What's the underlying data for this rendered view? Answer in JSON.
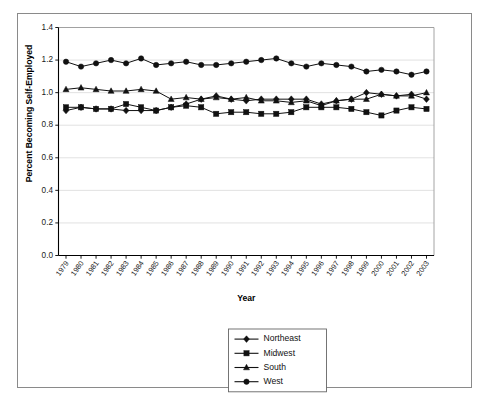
{
  "chart_data": {
    "type": "line",
    "title": "",
    "xlabel": "Year",
    "ylabel": "Percent Becoming Self-Employed",
    "ylim": [
      0.0,
      1.4
    ],
    "ytick_values": [
      0.0,
      0.2,
      0.4,
      0.6,
      0.8,
      1.0,
      1.2,
      1.4
    ],
    "ytick_labels": [
      "0.0",
      "0.2",
      "0.4",
      "0.6",
      "0.8",
      "1.0",
      "1.2",
      "1.4"
    ],
    "grid": "horizontal",
    "legend_position": "bottom-center",
    "x": [
      1979,
      1980,
      1981,
      1982,
      1983,
      1984,
      1985,
      1986,
      1987,
      1988,
      1989,
      1990,
      1991,
      1992,
      1993,
      1994,
      1995,
      1996,
      1997,
      1998,
      1999,
      2000,
      2001,
      2002,
      2003
    ],
    "xtick_labels": [
      "1979",
      "1980",
      "1981",
      "1982",
      "1983",
      "1984",
      "1985",
      "1986",
      "1987",
      "1988",
      "1989",
      "1990",
      "1991",
      "1992",
      "1993",
      "1994",
      "1995",
      "1996",
      "1997",
      "1998",
      "1999",
      "2000",
      "2001",
      "2002",
      "2003"
    ],
    "series": [
      {
        "name": "Northeast",
        "marker": "diamond",
        "values": [
          0.89,
          0.91,
          0.9,
          0.9,
          0.89,
          0.89,
          0.89,
          0.91,
          0.93,
          0.96,
          0.98,
          0.96,
          0.95,
          0.96,
          0.96,
          0.96,
          0.96,
          0.93,
          0.95,
          0.96,
          1.0,
          0.99,
          0.98,
          0.99,
          0.96
        ]
      },
      {
        "name": "Midwest",
        "marker": "square",
        "values": [
          0.91,
          0.91,
          0.9,
          0.9,
          0.93,
          0.91,
          0.89,
          0.91,
          0.92,
          0.91,
          0.87,
          0.88,
          0.88,
          0.87,
          0.87,
          0.88,
          0.91,
          0.91,
          0.91,
          0.9,
          0.88,
          0.86,
          0.89,
          0.91,
          0.9
        ]
      },
      {
        "name": "South",
        "marker": "triangle",
        "values": [
          1.02,
          1.03,
          1.02,
          1.01,
          1.01,
          1.02,
          1.01,
          0.96,
          0.97,
          0.96,
          0.97,
          0.96,
          0.97,
          0.95,
          0.95,
          0.94,
          0.95,
          0.92,
          0.95,
          0.96,
          0.96,
          0.99,
          0.98,
          0.98,
          1.0
        ]
      },
      {
        "name": "West",
        "marker": "circle",
        "values": [
          1.19,
          1.16,
          1.18,
          1.2,
          1.18,
          1.21,
          1.17,
          1.18,
          1.19,
          1.17,
          1.17,
          1.18,
          1.19,
          1.2,
          1.21,
          1.18,
          1.16,
          1.18,
          1.17,
          1.16,
          1.13,
          1.14,
          1.13,
          1.11,
          1.13
        ]
      }
    ]
  },
  "legend": {
    "entries": [
      {
        "label": "Northeast"
      },
      {
        "label": "Midwest"
      },
      {
        "label": "South"
      },
      {
        "label": "West"
      }
    ]
  }
}
